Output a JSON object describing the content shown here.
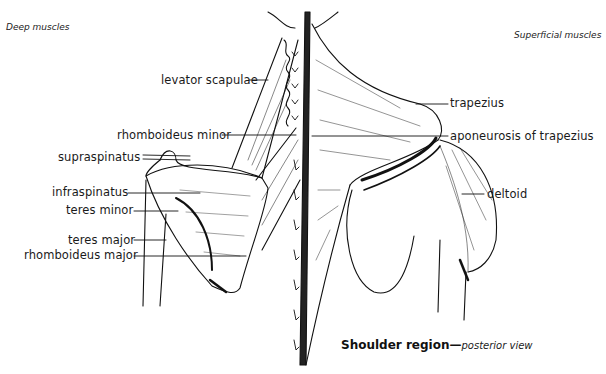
{
  "corners": {
    "left": "Deep muscles",
    "right": "Superficial muscles"
  },
  "labels_left": [
    {
      "id": "levator-scapulae",
      "text": "levator scapulae"
    },
    {
      "id": "rhomboideus-minor",
      "text": "rhomboideus minor"
    },
    {
      "id": "supraspinatus",
      "text": "supraspinatus"
    },
    {
      "id": "infraspinatus",
      "text": "infraspinatus"
    },
    {
      "id": "teres-minor",
      "text": "teres minor"
    },
    {
      "id": "teres-major",
      "text": "teres major"
    },
    {
      "id": "rhomboideus-major",
      "text": "rhomboideus major"
    }
  ],
  "labels_right": [
    {
      "id": "trapezius",
      "text": "trapezius"
    },
    {
      "id": "aponeurosis-of-trapezius",
      "text": "aponeurosis of trapezius"
    },
    {
      "id": "deltoid",
      "text": "deltoid"
    }
  ],
  "caption": {
    "title": "Shoulder region—",
    "subtitle": "posterior view"
  },
  "colors": {
    "ink": "#111111",
    "background": "#ffffff"
  }
}
